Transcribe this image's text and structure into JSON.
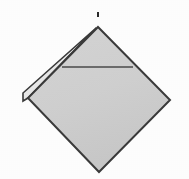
{
  "figure": {
    "background_color": "#ffffff",
    "canvas": {
      "width": 189,
      "height": 179
    },
    "caption": "",
    "shapes": {
      "main_panel": {
        "name": "main-diamond-panel",
        "description": "Large square rotated 45 degrees (diamond) with light grey fill and dark outline",
        "fill_color": "#d2d2d2",
        "stroke_color": "#3a3a3a",
        "stroke_width": 2,
        "points": "98,27 170,100 99,172 28,98"
      },
      "folded_flap": {
        "name": "folded-flap-sliver",
        "description": "Narrow sliver along the upper-left edge, a folded-back flap or second sheet edge",
        "fill_color": "#e9e9e9",
        "stroke_color": "#3a3a3a",
        "stroke_width": 1.6,
        "points": "96,28 23,93 23,101 28,98"
      },
      "crease_line": {
        "name": "horizontal-crease-line",
        "description": "Thin horizontal fold/crease line across the upper portion of the diamond",
        "stroke_color": "#4a4a4a",
        "stroke_width": 1.3,
        "x1": 62,
        "y1": 67,
        "x2": 133,
        "y2": 67
      },
      "apex_tick": {
        "name": "apex-tick-mark",
        "description": "Small dark tick mark above the top apex of the diamond",
        "color": "#2a2a2a",
        "x": 97,
        "y": 12,
        "width": 2,
        "height": 5
      }
    },
    "labels": []
  }
}
